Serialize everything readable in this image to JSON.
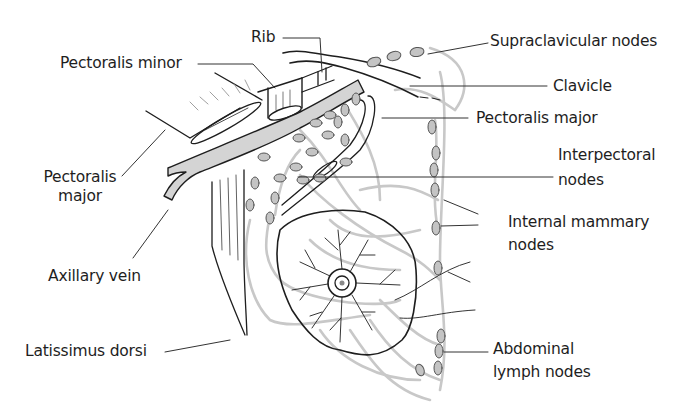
{
  "diagram": {
    "colors": {
      "outline": "#1e1e1e",
      "vein_fill": "#d4d4d4",
      "node_fill": "#c4c4c4",
      "lymph_vessel": "#c8c8c8",
      "background": "#ffffff"
    },
    "labels": {
      "rib": "Rib",
      "pectoralis_minor": "Pectoralis minor",
      "pectoralis_major_left": [
        "Pectoralis",
        "major"
      ],
      "axillary_vein": "Axillary vein",
      "latissimus_dorsi": "Latissimus dorsi",
      "supraclavicular_nodes": "Supraclavicular nodes",
      "clavicle": "Clavicle",
      "pectoralis_major_right": "Pectoralis major",
      "interpectoral_nodes": [
        "Interpectoral",
        "nodes"
      ],
      "internal_mammary_nodes": [
        "Internal mammary",
        "nodes"
      ],
      "abdominal_lymph_nodes": [
        "Abdominal",
        "lymph nodes"
      ]
    }
  }
}
